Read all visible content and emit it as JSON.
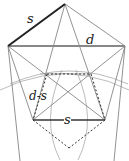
{
  "diagram": {
    "labels": {
      "side_top": "s",
      "diagonal": "d",
      "diff": "d-s",
      "side_bottom": "s"
    },
    "colors": {
      "line": "#555555",
      "thick": "#222222",
      "thin": "#888888",
      "arc": "#999999"
    }
  }
}
